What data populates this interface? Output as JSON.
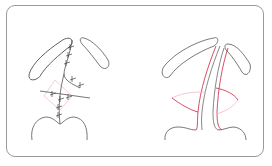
{
  "figure": {
    "panels": [
      {
        "name": "left-panel",
        "content": "sutured-closure"
      },
      {
        "name": "right-panel",
        "content": "incision-lines"
      }
    ],
    "colors": {
      "outline": "#555555",
      "frame": "#9a9a9a",
      "incision": "#d23a55",
      "light_incision": "#f0b8c4",
      "suture": "#444444"
    }
  }
}
